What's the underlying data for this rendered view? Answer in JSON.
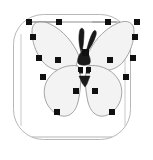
{
  "app": {
    "document_title": "butterfly",
    "tool": "node-editor",
    "canvas_size": {
      "width": 153,
      "height": 160
    }
  },
  "colors": {
    "background": "#ffffff",
    "frame_stroke": "#b8b8b8",
    "path_stroke": "#9a9a9a",
    "wing_fill": "#f3f3f3",
    "body_fill": "#1a1a1a",
    "node_fill": "#101010",
    "node_stroke": "#000000",
    "bbox_stroke": "#8c8c8c"
  },
  "frame": {
    "name": "rounded-rectangle-frame",
    "x": 13,
    "y": 14,
    "width": 117,
    "height": 125,
    "rx": 30,
    "stroke_width": 1
  },
  "selection_box": {
    "name": "selection-bounding-box",
    "top_line": {
      "x1": 29,
      "y1": 22,
      "x2": 117,
      "y2": 22
    },
    "left_line": {
      "x1": 29,
      "y1": 22,
      "x2": 29,
      "y2": 120
    },
    "right_line": {
      "x1": 117,
      "y1": 22,
      "x2": 117,
      "y2": 120
    },
    "bottom_line": {
      "x1": 29,
      "y1": 120,
      "x2": 117,
      "y2": 120
    }
  },
  "shape": {
    "name": "butterfly",
    "left_forewing_path": "M 73,52 C 69,43 60,30 46,23 C 37,19 31,22 31,29 C 31,38 33,48 40,57 C 48,66 60,68 69,62 Z",
    "right_forewing_path": "M 79,52 C 83,43 92,30 106,23 C 115,19 121,22 121,29 C 121,38 119,48 112,57 C 104,66 92,68 83,62 Z",
    "left_hindwing_path": "M 72,62 C 64,62 53,66 47,76 C 41,86 43,100 52,108 C 61,116 70,112 73,100 C 76,88 76,72 72,62 Z",
    "right_hindwing_path": "M 80,62 C 88,62 99,66 105,76 C 111,86 109,100 100,108 C 91,116 82,112 79,100 C 76,88 76,72 80,62 Z",
    "antenna_left_path": "M 76,52 C 74,46 73,38 76,32 C 78,29 81,30 81,34 C 81,40 79,47 77,52 Z",
    "antenna_right_path": "M 80,52 C 82,46 85,39 88,34 C 90,31 92,33 91,37 C 89,43 85,49 81,52 Z",
    "thorax_path": "M 76,46 C 72,50 70,55 71,59 C 72,62 81,62 82,59 C 83,55 81,50 77,46 Z",
    "abdomen_path": "M 72,74 L 82,74 L 79,84 L 76,86 L 74,83 Z",
    "abdomen_segment_left": {
      "x": 72,
      "y": 68,
      "width": 4,
      "height": 5
    },
    "abdomen_segment_right": {
      "x": 78,
      "y": 68,
      "width": 4,
      "height": 5
    }
  },
  "nodes": [
    {
      "id": 1,
      "name": "node-left-wing-top-outer",
      "x": 29,
      "y": 22,
      "type": "corner"
    },
    {
      "id": 2,
      "name": "node-left-wing-upper-edge",
      "x": 33,
      "y": 37,
      "type": "corner"
    },
    {
      "id": 3,
      "name": "node-left-wing-mid-outer",
      "x": 39,
      "y": 58,
      "type": "corner"
    },
    {
      "id": 4,
      "name": "node-left-wing-inner-mid",
      "x": 59,
      "y": 22,
      "type": "corner"
    },
    {
      "id": 5,
      "name": "node-left-wing-inner-low",
      "x": 58,
      "y": 60,
      "type": "corner"
    },
    {
      "id": 6,
      "name": "node-left-hindwing-outer",
      "x": 43,
      "y": 77,
      "type": "corner"
    },
    {
      "id": 7,
      "name": "node-left-hindwing-bottom",
      "x": 57,
      "y": 112,
      "type": "corner"
    },
    {
      "id": 8,
      "name": "node-left-abdomen-join",
      "x": 76,
      "y": 91,
      "type": "corner"
    },
    {
      "id": 9,
      "name": "node-right-abdomen-join",
      "x": 95,
      "y": 91,
      "type": "corner"
    },
    {
      "id": 10,
      "name": "node-right-hindwing-bottom",
      "x": 112,
      "y": 112,
      "type": "corner"
    },
    {
      "id": 11,
      "name": "node-right-hindwing-outer",
      "x": 126,
      "y": 77,
      "type": "corner"
    },
    {
      "id": 12,
      "name": "node-right-wing-inner-low",
      "x": 110,
      "y": 60,
      "type": "corner"
    },
    {
      "id": 13,
      "name": "node-right-wing-inner-mid",
      "x": 108,
      "y": 22,
      "type": "corner"
    },
    {
      "id": 14,
      "name": "node-right-wing-mid-outer",
      "x": 133,
      "y": 58,
      "type": "corner"
    },
    {
      "id": 15,
      "name": "node-right-wing-upper-edge",
      "x": 135,
      "y": 37,
      "type": "corner"
    },
    {
      "id": 16,
      "name": "node-right-wing-top-outer",
      "x": 137,
      "y": 22,
      "type": "corner"
    },
    {
      "id": 17,
      "name": "node-abdomen-left",
      "x": 81,
      "y": 70,
      "type": "corner"
    },
    {
      "id": 18,
      "name": "node-abdomen-right",
      "x": 89,
      "y": 70,
      "type": "corner"
    },
    {
      "id": 19,
      "name": "node-thorax-center",
      "x": 85,
      "y": 52,
      "type": "corner"
    }
  ],
  "node_style": {
    "size": 6,
    "shape": "square"
  }
}
